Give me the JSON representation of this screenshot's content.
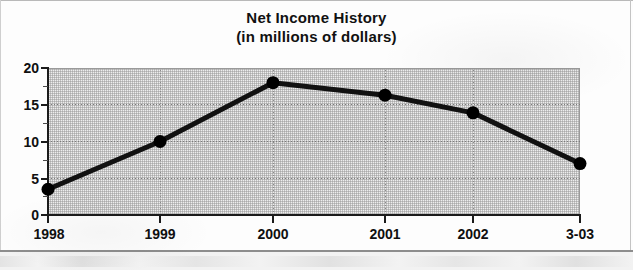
{
  "chart_data": {
    "type": "line",
    "title": "Net Income History",
    "subtitle": "(in millions of dollars)",
    "xlabel": "",
    "ylabel": "",
    "categories": [
      "1998",
      "1999",
      "2000",
      "2001",
      "2002",
      "3-03"
    ],
    "values": [
      3.5,
      10.0,
      18.0,
      16.3,
      13.9,
      7.0
    ],
    "ylim": [
      0,
      20
    ],
    "yticks": [
      0,
      5,
      10,
      15,
      20
    ],
    "ytick_labels": [
      "0",
      "5",
      "10",
      "15",
      "20"
    ],
    "y_minor_ticks": [
      2.5,
      7.5,
      12.5,
      17.5
    ],
    "grid": true,
    "grid_style": "dotted",
    "legend": null,
    "legend_position": "none",
    "series": [
      {
        "name": "Net Income",
        "values": [
          3.5,
          10.0,
          18.0,
          16.3,
          13.9,
          7.0
        ],
        "color": "#111111",
        "marker": "circle",
        "marker_size": 13,
        "line_width": 5
      }
    ],
    "colors": {
      "line": "#111111",
      "marker": "#111111",
      "plot_background": "#eeeeee",
      "axis": "#1b1b1b",
      "grid": "#7b7b7b",
      "text": "#101010",
      "page_background": "#ffffff"
    }
  },
  "chart": {
    "title_line1": "Net Income History",
    "title_line2": "(in millions of dollars)",
    "y_labels": [
      "20",
      "15",
      "10",
      "5",
      "0"
    ],
    "x_labels": [
      "1998",
      "1999",
      "2000",
      "2001",
      "2002",
      "3-03"
    ]
  }
}
